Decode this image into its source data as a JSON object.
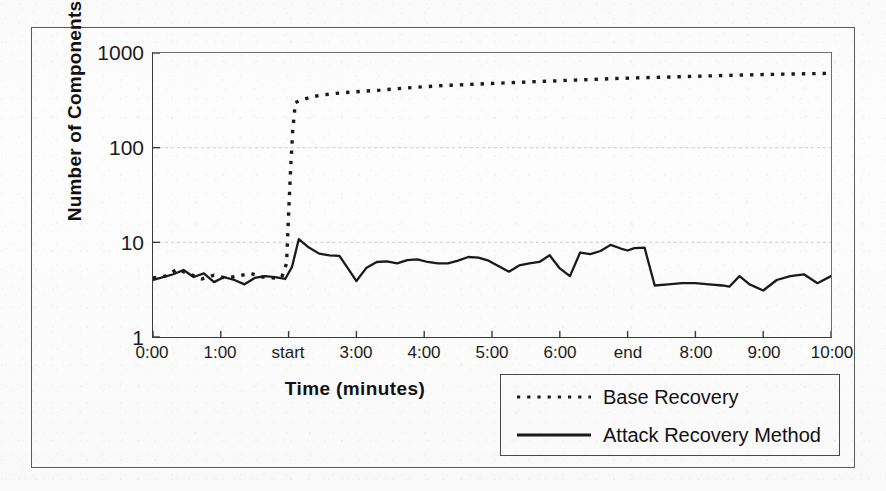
{
  "figure": {
    "y_axis_title": "Number of Components",
    "x_axis_title": "Time (minutes)"
  },
  "legend": {
    "entries": [
      {
        "label": "Base Recovery",
        "style": "dotted",
        "color": "#1a1a1a"
      },
      {
        "label": "Attack Recovery Method",
        "style": "solid",
        "color": "#1a1a1a"
      }
    ]
  },
  "chart_data": {
    "type": "line",
    "title": "",
    "xlabel": "Time (minutes)",
    "ylabel": "Number of Components",
    "yscale": "log",
    "ylim": [
      1,
      1000
    ],
    "ytick_labels": [
      "1000",
      "100",
      "10",
      "1"
    ],
    "ytick_values": [
      1000,
      100,
      10,
      1
    ],
    "xlim": [
      0,
      10
    ],
    "xtick_labels": [
      "0:00",
      "1:00",
      "start",
      "3:00",
      "4:00",
      "5:00",
      "6:00",
      "end",
      "8:00",
      "9:00",
      "10:00"
    ],
    "xtick_values": [
      0,
      1,
      2,
      3,
      4,
      5,
      6,
      7,
      8,
      9,
      10
    ],
    "grid": "horizontal-faint",
    "legend_position": "below-right",
    "annotations": [
      {
        "text": "start",
        "x": 2,
        "note": "attack begins"
      },
      {
        "text": "end",
        "x": 7,
        "note": "attack ends"
      }
    ],
    "series": [
      {
        "name": "Base Recovery",
        "style": "dotted",
        "color": "#1a1a1a",
        "x": [
          0.0,
          0.18,
          0.36,
          0.54,
          0.72,
          0.9,
          1.08,
          1.26,
          1.44,
          1.62,
          1.8,
          1.9,
          1.97,
          2.0,
          2.03,
          2.06,
          2.1,
          2.2,
          2.35,
          2.5,
          2.7,
          2.9,
          3.1,
          3.35,
          3.6,
          3.9,
          4.2,
          4.5,
          4.8,
          5.1,
          5.4,
          5.7,
          6.0,
          6.3,
          6.6,
          6.9,
          7.2,
          7.5,
          7.8,
          8.1,
          8.4,
          8.7,
          9.0,
          9.3,
          9.6,
          10.0
        ],
        "y": [
          4.2,
          4.4,
          5.2,
          4.6,
          4.1,
          4.5,
          4.2,
          4.4,
          4.7,
          4.3,
          4.2,
          4.3,
          6.0,
          20,
          60,
          150,
          300,
          320,
          345,
          360,
          375,
          385,
          395,
          405,
          420,
          435,
          450,
          460,
          470,
          480,
          490,
          500,
          510,
          520,
          530,
          540,
          548,
          555,
          562,
          570,
          578,
          585,
          592,
          598,
          603,
          610
        ]
      },
      {
        "name": "Attack Recovery Method",
        "style": "solid",
        "color": "#1a1a1a",
        "x": [
          0.0,
          0.15,
          0.3,
          0.45,
          0.6,
          0.75,
          0.9,
          1.05,
          1.2,
          1.35,
          1.5,
          1.65,
          1.8,
          1.95,
          2.05,
          2.15,
          2.3,
          2.45,
          2.6,
          2.75,
          2.9,
          3.0,
          3.15,
          3.3,
          3.45,
          3.6,
          3.75,
          3.9,
          4.05,
          4.2,
          4.35,
          4.5,
          4.65,
          4.8,
          4.95,
          5.1,
          5.25,
          5.4,
          5.55,
          5.7,
          5.85,
          6.0,
          6.15,
          6.3,
          6.45,
          6.6,
          6.75,
          6.9,
          7.0,
          7.1,
          7.25,
          7.4,
          7.6,
          7.8,
          8.0,
          8.2,
          8.4,
          8.5,
          8.65,
          8.8,
          9.0,
          9.2,
          9.4,
          9.6,
          9.8,
          10.0
        ],
        "y": [
          4.0,
          4.3,
          4.6,
          5.1,
          4.3,
          4.7,
          3.8,
          4.3,
          4.0,
          3.6,
          4.2,
          4.4,
          4.3,
          4.1,
          5.5,
          10.8,
          8.8,
          7.6,
          7.3,
          7.2,
          5.0,
          3.9,
          5.4,
          6.2,
          6.3,
          6.0,
          6.5,
          6.6,
          6.2,
          6.0,
          6.0,
          6.4,
          7.0,
          6.9,
          6.4,
          5.6,
          4.9,
          5.7,
          6.0,
          6.2,
          7.3,
          5.3,
          4.4,
          7.8,
          7.5,
          8.1,
          9.4,
          8.6,
          8.2,
          8.7,
          8.8,
          3.5,
          3.6,
          3.7,
          3.7,
          3.6,
          3.5,
          3.4,
          4.4,
          3.6,
          3.1,
          4.0,
          4.4,
          4.6,
          3.7,
          4.4
        ]
      }
    ]
  }
}
